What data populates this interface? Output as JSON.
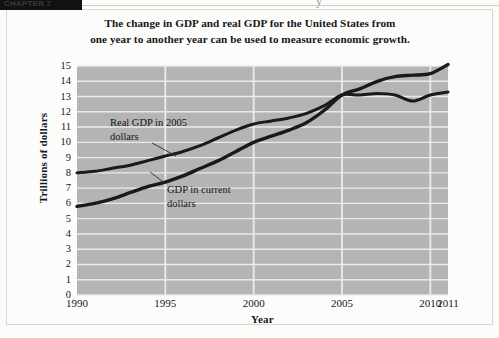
{
  "header": {
    "tab_label": "CHAPTER 7",
    "cut_glyph": "y"
  },
  "title": {
    "line1": "The change in GDP and real GDP for the United States from",
    "line2": "one year to another year can be used to measure economic growth."
  },
  "axes": {
    "ylabel": "Trillions of dollars",
    "xlabel": "Year",
    "yticks": [
      "15",
      "14",
      "13",
      "12",
      "11",
      "10",
      "9",
      "8",
      "7",
      "6",
      "5",
      "4",
      "3",
      "2",
      "1",
      "0"
    ],
    "xticks": [
      "1990",
      "1995",
      "2000",
      "2005",
      "2010",
      "2011"
    ]
  },
  "annotations": {
    "real_gdp_line1": "Real GDP in 2005",
    "real_gdp_line2": "dollars",
    "current_gdp_line1": "GDP in current",
    "current_gdp_line2": "dollars"
  },
  "colors": {
    "plot_background": "#b4b4b4",
    "gridline": "#ebebeb",
    "line": "#1a1a1a",
    "page_background": "#fcfcfb",
    "text": "#17161a"
  },
  "chart_data": {
    "type": "line",
    "title": "The change in GDP and real GDP for the United States from one year to another year can be used to measure economic growth.",
    "xlabel": "Year",
    "ylabel": "Trillions of dollars",
    "xlim": [
      1990,
      2011
    ],
    "ylim": [
      0,
      15
    ],
    "grid": true,
    "legend_position": "inline-annotation",
    "x": [
      1990,
      1991,
      1992,
      1993,
      1994,
      1995,
      1996,
      1997,
      1998,
      1999,
      2000,
      2001,
      2002,
      2003,
      2004,
      2005,
      2006,
      2007,
      2008,
      2009,
      2010,
      2011
    ],
    "series": [
      {
        "name": "Real GDP in 2005 dollars",
        "values": [
          8.0,
          8.1,
          8.3,
          8.5,
          8.8,
          9.1,
          9.4,
          9.8,
          10.3,
          10.8,
          11.2,
          11.4,
          11.6,
          11.9,
          12.4,
          13.1,
          13.1,
          13.2,
          13.1,
          12.7,
          13.1,
          13.3
        ]
      },
      {
        "name": "GDP in current dollars",
        "values": [
          5.8,
          6.0,
          6.3,
          6.7,
          7.1,
          7.4,
          7.8,
          8.3,
          8.8,
          9.4,
          10.0,
          10.4,
          10.8,
          11.3,
          12.1,
          13.1,
          13.5,
          14.0,
          14.3,
          14.4,
          14.5,
          15.1
        ]
      }
    ]
  }
}
